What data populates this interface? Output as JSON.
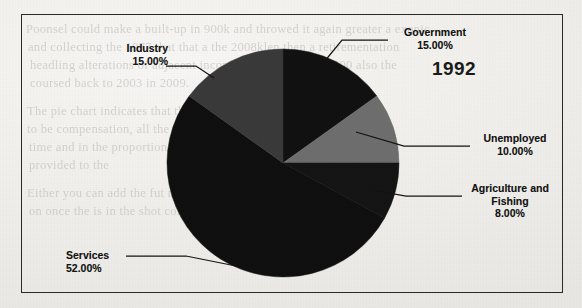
{
  "figure": {
    "year_label": "1992",
    "border_color": "#2a2a2a",
    "background_color": "#efeeea"
  },
  "bleed_text": {
    "line1": "Poonsel could make a built-up in 900k and throwed it again greater a exonic",
    "line2": "and collecting the 1977 that that a the 2008klen then a retirementation",
    "line3": "headling alterations of adjacent incommonly worker, in 2000 also the",
    "line4": "coursed back to 2003 in 2009.",
    "line5": "The pie chart indicates that the the the the the positioning of and",
    "line6": "to be compensation, all the their over the stone period the",
    "line7": "time and in the proportion of the pie wider benefit altogether",
    "line8": "provided to the",
    "line9": "Either you can add the fut nacon there a that could a ship in the",
    "line10": "on once the is in the shot  comment in one for"
  },
  "chart_data": {
    "type": "pie",
    "title": "1992",
    "start_angle": 0,
    "direction": "clockwise",
    "legend": "labels-with-leader-lines",
    "categories": [
      "Government",
      "Unemployed",
      "Agriculture and Fishing",
      "Services",
      "Industry"
    ],
    "values": [
      15.0,
      10.0,
      8.0,
      52.0,
      15.0
    ],
    "value_suffix": "%",
    "slices": [
      {
        "name": "Government",
        "label": "Government",
        "value": 15.0,
        "value_text": "15.00%",
        "color": "#121212",
        "start_pct": 0,
        "end_pct": 15
      },
      {
        "name": "Unemployed",
        "label": "Unemployed",
        "value": 10.0,
        "value_text": "10.00%",
        "color": "#6e6e6e",
        "start_pct": 15,
        "end_pct": 25
      },
      {
        "name": "Agriculture and Fishing",
        "label_line1": "Agriculture and",
        "label_line2": "Fishing",
        "value": 8.0,
        "value_text": "8.00%",
        "color": "#151515",
        "start_pct": 25,
        "end_pct": 33
      },
      {
        "name": "Services",
        "label": "Services",
        "value": 52.0,
        "value_text": "52.00%",
        "color": "#101010",
        "start_pct": 33,
        "end_pct": 85
      },
      {
        "name": "Industry",
        "label": "Industry",
        "value": 15.0,
        "value_text": "15.00%",
        "color": "#3a3a3a",
        "start_pct": 85,
        "end_pct": 100
      }
    ]
  }
}
